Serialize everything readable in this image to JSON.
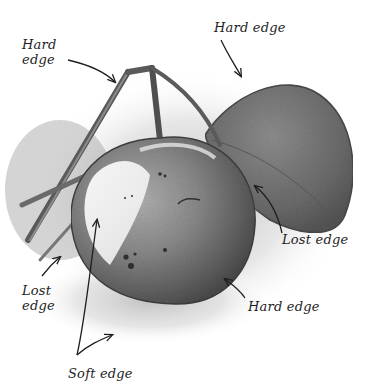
{
  "illustration": {
    "subject": "Pencil drawing of an apple on a branch with a leaf",
    "labels": {
      "hard_edge_top_left": "Hard\nedge",
      "hard_edge_top_right": "Hard edge",
      "lost_edge_right": "Lost edge",
      "hard_edge_bottom_right": "Hard edge",
      "lost_edge_left": "Lost\nedge",
      "soft_edge_bottom": "Soft edge"
    },
    "colors": {
      "background": "#ffffff",
      "ink": "#1e1e1e",
      "graphite_dark": "#4a4a4a",
      "graphite_mid": "#7c7c7c",
      "graphite_light": "#c9c9c9"
    }
  }
}
